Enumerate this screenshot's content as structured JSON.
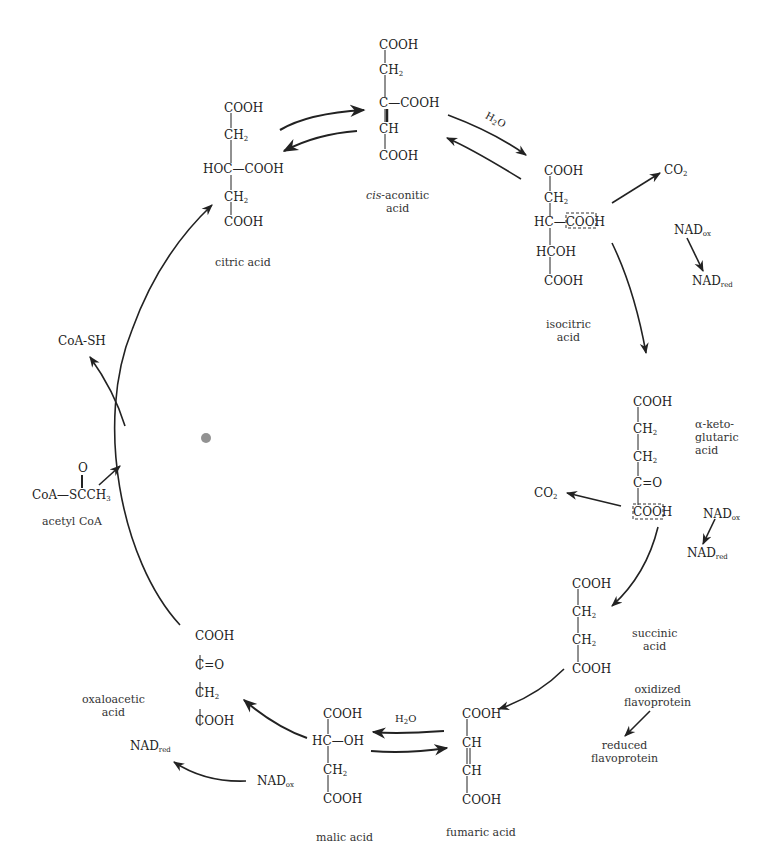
{
  "diagram": {
    "compounds": {
      "citric_acid": {
        "name": "citric acid",
        "formula_lines": [
          "COOH",
          "CH2",
          "HOC—COOH",
          "CH2",
          "COOH"
        ]
      },
      "cis_aconitic_acid": {
        "name_prefix": "cis",
        "name_rest": "-aconitic",
        "name_line2": "acid",
        "formula_lines": [
          "COOH",
          "CH2",
          "C—COOH",
          "CH",
          "COOH"
        ]
      },
      "isocitric_acid": {
        "name_line1": "isocitric",
        "name_line2": "acid",
        "formula_lines": [
          "COOH",
          "CH2",
          "HC—COOH",
          "HCOH",
          "COOH"
        ]
      },
      "alpha_ketoglutaric_acid": {
        "name_line1": "α-keto-",
        "name_line2": "glutaric",
        "name_line3": "acid",
        "formula_lines": [
          "COOH",
          "CH2",
          "CH2",
          "C=O",
          "COOH"
        ]
      },
      "succinic_acid": {
        "name_line1": "succinic",
        "name_line2": "acid",
        "formula_lines": [
          "COOH",
          "CH2",
          "CH2",
          "COOH"
        ]
      },
      "fumaric_acid": {
        "name": "fumaric acid",
        "formula_lines": [
          "COOH",
          "CH",
          "CH",
          "COOH"
        ]
      },
      "malic_acid": {
        "name": "malic acid",
        "formula_lines": [
          "COOH",
          "HC—OH",
          "CH2",
          "COOH"
        ]
      },
      "oxaloacetic_acid": {
        "name_line1": "oxaloacetic",
        "name_line2": "acid",
        "formula_lines": [
          "COOH",
          "C=O",
          "CH2",
          "COOH"
        ]
      },
      "acetyl_coa": {
        "name": "acetyl CoA",
        "formula": "CoA—SCCH3",
        "carbonyl_o": "O"
      }
    },
    "side_products": {
      "coa_sh": "CoA-SH",
      "h2o_top": "H2O",
      "h2o_bottom": "H2O",
      "co2_iso": "CO2",
      "co2_keto": "CO2",
      "nad_ox_1": "NAD",
      "nad_red_1": "NAD",
      "nad_ox_2": "NAD",
      "nad_red_2": "NAD",
      "nad_ox_3": "NAD",
      "nad_red_3": "NAD",
      "ox_sub": "ox",
      "red_sub": "red",
      "oxidized_flavoprotein_line1": "oxidized",
      "oxidized_flavoprotein_line2": "flavoprotein",
      "reduced_flavoprotein_line1": "reduced",
      "reduced_flavoprotein_line2": "flavoprotein"
    },
    "text_parts": {
      "COOH": "COOH",
      "CH": "CH",
      "C": "C",
      "H": "H",
      "O": "O",
      "HC": "HC",
      "HOC": "HOC",
      "OH": "OH",
      "HCOH": "HCOH",
      "Co": "CO",
      "bond": "—",
      "dbl": "=",
      "sub2": "2",
      "sub3": "3",
      "H2O_H": "H",
      "H2O_O": "O",
      "CoA": "CoA",
      "SCCH": "SCCH"
    },
    "colors": {
      "ink": "#222222",
      "background": "#ffffff"
    }
  }
}
